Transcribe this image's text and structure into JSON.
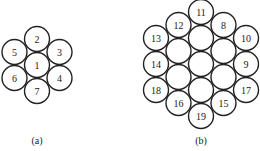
{
  "diagram_a": {
    "caption": "(a)",
    "radius": 12.5,
    "circles": [
      {
        "label": "1",
        "x": 37,
        "y": 65
      },
      {
        "label": "2",
        "x": 37,
        "y": 39
      },
      {
        "label": "3",
        "x": 59.5,
        "y": 52
      },
      {
        "label": "4",
        "x": 59.5,
        "y": 78
      },
      {
        "label": "5",
        "x": 14.5,
        "y": 52
      },
      {
        "label": "6",
        "x": 14.5,
        "y": 78
      },
      {
        "label": "7",
        "x": 37,
        "y": 91
      }
    ]
  },
  "diagram_b": {
    "caption": "(b)",
    "radius": 12.5,
    "circles": [
      {
        "label": "11",
        "x": 201,
        "y": 12
      },
      {
        "label": "",
        "x": 201,
        "y": 38
      },
      {
        "label": "",
        "x": 201,
        "y": 64
      },
      {
        "label": "",
        "x": 201,
        "y": 90
      },
      {
        "label": "19",
        "x": 201,
        "y": 116
      },
      {
        "label": "12",
        "x": 178.5,
        "y": 25
      },
      {
        "label": "",
        "x": 178.5,
        "y": 51
      },
      {
        "label": "",
        "x": 178.5,
        "y": 77
      },
      {
        "label": "16",
        "x": 178.5,
        "y": 103
      },
      {
        "label": "8",
        "x": 223.5,
        "y": 25
      },
      {
        "label": "",
        "x": 223.5,
        "y": 51
      },
      {
        "label": "",
        "x": 223.5,
        "y": 77
      },
      {
        "label": "15",
        "x": 223.5,
        "y": 103
      },
      {
        "label": "13",
        "x": 156,
        "y": 38
      },
      {
        "label": "14",
        "x": 156,
        "y": 64
      },
      {
        "label": "18",
        "x": 156,
        "y": 90
      },
      {
        "label": "10",
        "x": 246,
        "y": 38
      },
      {
        "label": "9",
        "x": 246,
        "y": 64
      },
      {
        "label": "17",
        "x": 246,
        "y": 90
      }
    ]
  }
}
